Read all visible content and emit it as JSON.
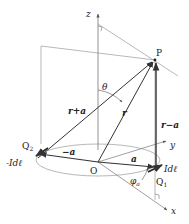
{
  "diagram": {
    "labels": {
      "z_axis": "z",
      "y_axis": "y",
      "x_axis": "x",
      "point_p": "P",
      "origin": "O",
      "q1": "Q",
      "q1_sub": "1",
      "q2": "Q",
      "q2_sub": "2",
      "theta": "θ",
      "phi": "φ",
      "phi_sub": "a",
      "vec_r": "r",
      "vec_r_plus_a": "r+a",
      "vec_r_minus_a": "r−a",
      "vec_a": "a",
      "vec_neg_a": "−a",
      "current_pos": "Idℓ",
      "current_neg": "-Idℓ"
    },
    "colors": {
      "line": "#333333",
      "thin_line": "#777777",
      "background": "#ffffff"
    }
  }
}
